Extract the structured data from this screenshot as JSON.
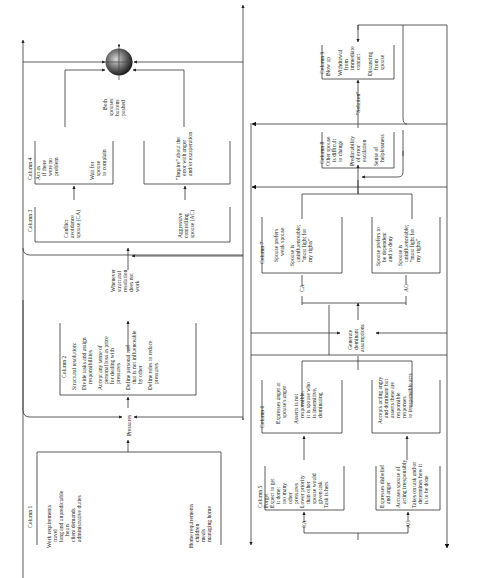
{
  "diagram": {
    "orientation": "rotated-90-ccw",
    "columns": {
      "col1": {
        "title": "Column 1",
        "work": [
          "Work requirements",
          "travel",
          "long and unpredictable",
          "hours",
          "client demands",
          "administrative duties"
        ],
        "home": [
          "Home requirements",
          "children",
          "meals",
          "managing home"
        ]
      },
      "pressures": "Pressures",
      "col2": {
        "title": "Column 2",
        "lines": [
          "Structural resolution:",
          "",
          "Divide tasks and assign",
          "responsibilities",
          "",
          "Accept any sense of",
          "personal loss as price",
          "for dealing with",
          "pressures",
          "",
          "Define personal turf",
          "that is not influenceable",
          "by other",
          "",
          "Define roles to reduce",
          "pressures"
        ]
      },
      "whenever": [
        "Whenever",
        "structural",
        "resolution",
        "does not",
        "work"
      ],
      "col3": {
        "title": "Column 3",
        "ca": [
          "Conflict",
          "avoidance",
          "spouse (CA)"
        ],
        "ac": [
          "Aggressive",
          "controlling",
          "spouse (AC)"
        ]
      },
      "col4": {
        "title": "Column 4",
        "ca_a": [
          "Act as",
          "if there",
          "were no",
          "problem"
        ],
        "ca_b": [
          "Wait for",
          "spouse",
          "to complain"
        ],
        "ac": [
          "\"Inquire\" about the",
          "error with anger",
          "and/or exasperation"
        ]
      },
      "buttons": [
        "Both",
        "spouses'",
        "buttons",
        "pushed"
      ],
      "col5": {
        "title": "Column 5",
        "ca": [
          "Forget",
          "Expect to get",
          "it done:",
          "too many",
          "other",
          "pressures",
          "Lower priority",
          "than other",
          "spouse would",
          "given task",
          "Task is hers"
        ],
        "ac": [
          "Expresses disbelief",
          "and anger",
          "",
          "Accuses spouse of",
          "acting irresponsibly",
          "",
          "Takes on task and/or",
          "determines how it",
          "is to be done"
        ],
        "ca_label": "CA",
        "ac_label": "AC"
      },
      "col6": {
        "title": "Column 6",
        "ca": [
          "Expresses anger at",
          "spouse's anger",
          "",
          "Asserts is not",
          "responsible,",
          "it is spouse who",
          "is insensitive,",
          "dominating"
        ],
        "ac": [
          "Accepts acting angry",
          "and dominant but",
          "asserts these are",
          "responsible",
          "responses",
          "to irresponsible acts"
        ]
      },
      "generate": [
        "Generate",
        "dominant",
        "assumptions"
      ],
      "col7": {
        "title": "Column 7",
        "ca": [
          "Spouse prefers",
          "weak spouse",
          "",
          "Spouse is",
          "uninfluenceable;",
          "\"must fight for",
          "my rights\""
        ],
        "ac": [
          "Spouse prefers to",
          "be dependent",
          "and to deny",
          "",
          "Spouse is",
          "uninfluenceable;",
          "\"must fight for",
          "my rights\""
        ],
        "ca_label": "CA",
        "ac_label": "AC"
      },
      "col8": {
        "title": "Column 8",
        "lines": [
          "Other spouse",
          "is difficult",
          "to change",
          "",
          "Predictability",
          "of error",
          "escalation",
          "",
          "Sense of",
          "helplessness"
        ]
      },
      "solution": "\"Solution\"",
      "col9": {
        "title": "Column 9",
        "lines": [
          "Blow up",
          "",
          "Withdrawal",
          "from",
          "immediate",
          "contact",
          "",
          "Distancing",
          "from",
          "spouse"
        ]
      }
    },
    "colors": {
      "line": "#333333",
      "text": "#222222",
      "sphere_dark": "#111111",
      "sphere_light": "#cccccc"
    }
  }
}
